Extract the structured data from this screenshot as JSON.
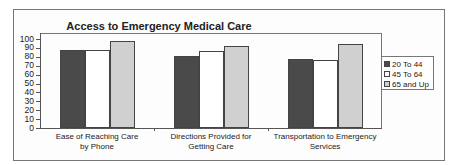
{
  "chart_data": {
    "type": "bar",
    "title": "Access to Emergency Medical Care",
    "xlabel": "",
    "ylabel": "",
    "ylim": [
      0,
      100
    ],
    "yticks": [
      0,
      10,
      20,
      30,
      40,
      50,
      60,
      70,
      80,
      90,
      100
    ],
    "grid": false,
    "legend_position": "right",
    "categories": [
      "Ease of Reaching Care by Phone",
      "Directions Provided for Getting Care",
      "Transportation to Emergency Services"
    ],
    "category_lines": [
      [
        "Ease of Reaching Care",
        "by Phone"
      ],
      [
        "Directions Provided for",
        "Getting Care"
      ],
      [
        "Transportation to Emergency",
        "Services"
      ]
    ],
    "series": [
      {
        "name": "20 To 44",
        "color": "#4a4a4a",
        "values": [
          88,
          81,
          78
        ]
      },
      {
        "name": "45 To 64",
        "color": "#ffffff",
        "values": [
          88,
          87,
          76
        ]
      },
      {
        "name": "65 and Up",
        "color": "#d0d0d0",
        "values": [
          98,
          92,
          94
        ]
      }
    ]
  }
}
